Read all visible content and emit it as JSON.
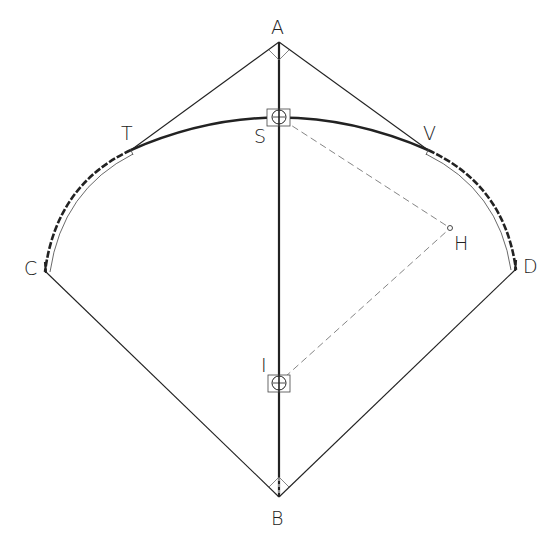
{
  "diagram": {
    "type": "geometric-construction",
    "labels": {
      "A": "A",
      "B": "B",
      "C": "C",
      "D": "D",
      "S": "S",
      "T": "T",
      "V": "V",
      "H": "H",
      "I": "I"
    },
    "points": {
      "A": [
        279,
        42
      ],
      "B": [
        279,
        497
      ],
      "C": [
        46,
        272
      ],
      "D": [
        515,
        270
      ],
      "S": [
        279,
        117
      ],
      "T": [
        131,
        150
      ],
      "V": [
        428,
        150
      ],
      "H": [
        450,
        228
      ],
      "I": [
        279,
        383
      ]
    },
    "colors": {
      "stroke": "#222222",
      "dashed": "#777777",
      "background": "#ffffff"
    }
  }
}
